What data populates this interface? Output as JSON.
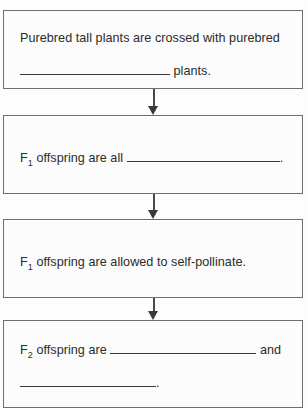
{
  "diagram": {
    "type": "flowchart",
    "orientation": "vertical",
    "border_color": "#6e6e6e",
    "text_color": "#2b2b2b",
    "background_color": "#fcfcfc",
    "steps": [
      {
        "id": "step-1",
        "lines": [
          {
            "before": "Purebred tall plants are crossed with purebred",
            "blank": false,
            "after": ""
          },
          {
            "before": "",
            "blank": true,
            "after": " plants."
          }
        ]
      },
      {
        "id": "step-2",
        "lines": [
          {
            "before": "F",
            "sub": "1",
            "mid": " offspring are all ",
            "blank": true,
            "after": "."
          }
        ]
      },
      {
        "id": "step-3",
        "lines": [
          {
            "before": "F",
            "sub": "1",
            "mid": " offspring are allowed to self-pollinate.",
            "blank": false,
            "after": ""
          }
        ]
      },
      {
        "id": "step-4",
        "lines": [
          {
            "before": "F",
            "sub": "2",
            "mid": " offspring are ",
            "blank": true,
            "after": " and"
          },
          {
            "before": "",
            "blank": true,
            "after": "."
          }
        ]
      }
    ],
    "connectors": [
      {
        "id": "arrow-1",
        "from": "step-1",
        "to": "step-2",
        "glyph": "down-arrow"
      },
      {
        "id": "arrow-2",
        "from": "step-2",
        "to": "step-3",
        "glyph": "down-arrow"
      },
      {
        "id": "arrow-3",
        "from": "step-3",
        "to": "step-4",
        "glyph": "down-arrow"
      }
    ]
  },
  "text": {
    "s1_line1": "Purebred tall plants are crossed with purebred",
    "s1_line2_after": "plants.",
    "s2_f": "F",
    "s2_sub": "1",
    "s2_mid": "offspring are all",
    "s2_after": ".",
    "s3_f": "F",
    "s3_sub": "1",
    "s3_mid": "offspring are allowed to self-pollinate.",
    "s4_f": "F",
    "s4_sub": "2",
    "s4_mid": "offspring are",
    "s4_after": "and",
    "s4_line2_after": "."
  }
}
